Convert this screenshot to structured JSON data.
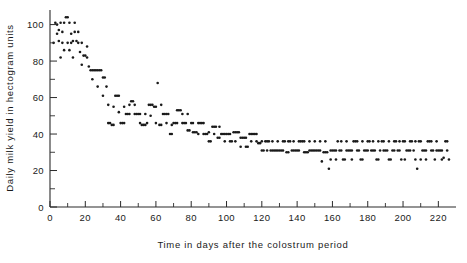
{
  "chart_data": {
    "type": "scatter",
    "title": "",
    "xlabel": "Time in days after the colostrum period",
    "ylabel": "Daily milk yield in hectogram units",
    "xlim": [
      0,
      230
    ],
    "ylim": [
      0,
      108
    ],
    "xticks": [
      0,
      20,
      40,
      60,
      80,
      100,
      120,
      140,
      160,
      180,
      200,
      220
    ],
    "yticks": [
      0,
      20,
      40,
      60,
      80,
      100
    ],
    "xtick_labels": [
      "0",
      "20",
      "40",
      "60",
      "80",
      "100",
      "120",
      "140",
      "160",
      "180",
      "200",
      "220"
    ],
    "ytick_labels": [
      "0",
      "20",
      "40",
      "60",
      "80",
      "100"
    ],
    "x_minor_step": 10,
    "y_minor_step": 10,
    "grid": false,
    "legend": null,
    "marker": "dot",
    "marker_size": 1.3,
    "marker_color": "#1a1a1a",
    "points": [
      [
        2,
        90
      ],
      [
        3,
        101
      ],
      [
        4,
        100
      ],
      [
        4,
        95
      ],
      [
        5,
        91
      ],
      [
        5,
        97
      ],
      [
        6,
        101
      ],
      [
        7,
        90
      ],
      [
        7,
        96
      ],
      [
        8,
        86
      ],
      [
        9,
        104
      ],
      [
        10,
        104
      ],
      [
        11,
        101
      ],
      [
        12,
        95
      ],
      [
        12,
        90
      ],
      [
        13,
        82
      ],
      [
        14,
        101
      ],
      [
        14,
        96
      ],
      [
        15,
        91
      ],
      [
        16,
        90
      ],
      [
        17,
        85
      ],
      [
        18,
        78
      ],
      [
        19,
        83
      ],
      [
        20,
        83
      ],
      [
        21,
        82
      ],
      [
        22,
        77
      ],
      [
        23,
        75
      ],
      [
        24,
        75
      ],
      [
        25,
        75
      ],
      [
        26,
        75
      ],
      [
        27,
        75
      ],
      [
        28,
        75
      ],
      [
        29,
        75
      ],
      [
        30,
        71
      ],
      [
        31,
        71
      ],
      [
        32,
        66
      ],
      [
        33,
        46
      ],
      [
        34,
        46
      ],
      [
        35,
        45
      ],
      [
        36,
        45
      ],
      [
        37,
        61
      ],
      [
        38,
        61
      ],
      [
        39,
        61
      ],
      [
        40,
        46
      ],
      [
        41,
        46
      ],
      [
        42,
        46
      ],
      [
        43,
        51
      ],
      [
        44,
        51
      ],
      [
        45,
        51
      ],
      [
        46,
        58
      ],
      [
        47,
        58
      ],
      [
        48,
        51
      ],
      [
        49,
        51
      ],
      [
        50,
        51
      ],
      [
        51,
        51
      ],
      [
        52,
        45
      ],
      [
        53,
        45
      ],
      [
        54,
        45
      ],
      [
        55,
        46
      ],
      [
        56,
        56
      ],
      [
        57,
        56
      ],
      [
        58,
        56
      ],
      [
        59,
        55
      ],
      [
        60,
        55
      ],
      [
        61,
        68
      ],
      [
        62,
        45
      ],
      [
        63,
        45
      ],
      [
        64,
        51
      ],
      [
        65,
        51
      ],
      [
        66,
        51
      ],
      [
        67,
        51
      ],
      [
        68,
        40
      ],
      [
        69,
        40
      ],
      [
        70,
        46
      ],
      [
        71,
        46
      ],
      [
        72,
        53
      ],
      [
        73,
        53
      ],
      [
        74,
        53
      ],
      [
        75,
        46
      ],
      [
        76,
        46
      ],
      [
        77,
        46
      ],
      [
        78,
        42
      ],
      [
        79,
        42
      ],
      [
        80,
        46
      ],
      [
        81,
        41
      ],
      [
        82,
        41
      ],
      [
        83,
        41
      ],
      [
        84,
        46
      ],
      [
        85,
        46
      ],
      [
        86,
        46
      ],
      [
        87,
        46
      ],
      [
        88,
        40
      ],
      [
        89,
        40
      ],
      [
        90,
        36
      ],
      [
        91,
        36
      ],
      [
        92,
        44
      ],
      [
        93,
        44
      ],
      [
        94,
        44
      ],
      [
        95,
        38
      ],
      [
        96,
        38
      ],
      [
        97,
        40
      ],
      [
        98,
        40
      ],
      [
        99,
        40
      ],
      [
        100,
        40
      ],
      [
        101,
        40
      ],
      [
        102,
        36
      ],
      [
        103,
        36
      ],
      [
        104,
        41
      ],
      [
        105,
        41
      ],
      [
        106,
        41
      ],
      [
        107,
        41
      ],
      [
        108,
        38
      ],
      [
        109,
        38
      ],
      [
        110,
        38
      ],
      [
        111,
        33
      ],
      [
        112,
        33
      ],
      [
        113,
        40
      ],
      [
        114,
        40
      ],
      [
        115,
        40
      ],
      [
        116,
        40
      ],
      [
        117,
        40
      ],
      [
        118,
        35
      ],
      [
        119,
        35
      ],
      [
        120,
        31
      ],
      [
        121,
        31
      ],
      [
        122,
        36
      ],
      [
        123,
        36
      ],
      [
        124,
        36
      ],
      [
        125,
        31
      ],
      [
        126,
        31
      ],
      [
        127,
        31
      ],
      [
        128,
        31
      ],
      [
        129,
        31
      ],
      [
        130,
        31
      ],
      [
        131,
        31
      ],
      [
        132,
        36
      ],
      [
        133,
        36
      ],
      [
        134,
        30
      ],
      [
        135,
        30
      ],
      [
        136,
        36
      ],
      [
        137,
        31
      ],
      [
        138,
        31
      ],
      [
        139,
        31
      ],
      [
        140,
        31
      ],
      [
        141,
        31
      ],
      [
        142,
        36
      ],
      [
        143,
        36
      ],
      [
        144,
        30
      ],
      [
        145,
        30
      ],
      [
        146,
        30
      ],
      [
        147,
        31
      ],
      [
        148,
        31
      ],
      [
        149,
        31
      ],
      [
        150,
        36
      ],
      [
        151,
        31
      ],
      [
        152,
        31
      ],
      [
        153,
        31
      ],
      [
        154,
        25
      ],
      [
        155,
        30
      ],
      [
        156,
        30
      ],
      [
        157,
        30
      ],
      [
        158,
        21
      ],
      [
        159,
        31
      ],
      [
        160,
        31
      ],
      [
        161,
        31
      ],
      [
        162,
        31
      ],
      [
        163,
        36
      ],
      [
        164,
        31
      ],
      [
        165,
        31
      ],
      [
        166,
        26
      ],
      [
        167,
        26
      ],
      [
        168,
        31
      ],
      [
        169,
        31
      ],
      [
        170,
        31
      ],
      [
        171,
        31
      ],
      [
        172,
        36
      ],
      [
        173,
        36
      ],
      [
        174,
        31
      ],
      [
        175,
        31
      ],
      [
        176,
        26
      ],
      [
        177,
        26
      ],
      [
        178,
        31
      ],
      [
        179,
        31
      ],
      [
        180,
        36
      ],
      [
        181,
        36
      ],
      [
        182,
        31
      ],
      [
        183,
        31
      ],
      [
        184,
        31
      ],
      [
        185,
        26
      ],
      [
        186,
        26
      ],
      [
        187,
        31
      ],
      [
        188,
        36
      ],
      [
        189,
        36
      ],
      [
        190,
        31
      ],
      [
        191,
        31
      ],
      [
        192,
        26
      ],
      [
        193,
        26
      ],
      [
        194,
        31
      ],
      [
        195,
        36
      ],
      [
        196,
        36
      ],
      [
        197,
        31
      ],
      [
        198,
        31
      ],
      [
        199,
        26
      ],
      [
        200,
        36
      ],
      [
        201,
        36
      ],
      [
        202,
        31
      ],
      [
        203,
        31
      ],
      [
        204,
        36
      ],
      [
        205,
        36
      ],
      [
        206,
        31
      ],
      [
        207,
        26
      ],
      [
        208,
        21
      ],
      [
        209,
        36
      ],
      [
        210,
        36
      ],
      [
        211,
        31
      ],
      [
        212,
        31
      ],
      [
        213,
        26
      ],
      [
        214,
        36
      ],
      [
        215,
        36
      ],
      [
        216,
        31
      ],
      [
        217,
        31
      ],
      [
        218,
        26
      ],
      [
        219,
        36
      ],
      [
        220,
        31
      ],
      [
        221,
        31
      ],
      [
        222,
        26
      ],
      [
        223,
        27
      ],
      [
        224,
        36
      ],
      [
        225,
        31
      ],
      [
        226,
        26
      ],
      [
        6,
        82
      ],
      [
        8,
        101
      ],
      [
        10,
        90
      ],
      [
        11,
        86
      ],
      [
        13,
        91
      ],
      [
        16,
        96
      ],
      [
        18,
        90
      ],
      [
        21,
        88
      ],
      [
        24,
        70
      ],
      [
        27,
        66
      ],
      [
        30,
        61
      ],
      [
        33,
        56
      ],
      [
        36,
        55
      ],
      [
        39,
        52
      ],
      [
        42,
        55
      ],
      [
        45,
        56
      ],
      [
        48,
        56
      ],
      [
        51,
        46
      ],
      [
        54,
        51
      ],
      [
        57,
        50
      ],
      [
        60,
        46
      ],
      [
        63,
        56
      ],
      [
        66,
        46
      ],
      [
        69,
        45
      ],
      [
        72,
        46
      ],
      [
        75,
        51
      ],
      [
        78,
        51
      ],
      [
        81,
        46
      ],
      [
        84,
        40
      ],
      [
        87,
        40
      ],
      [
        90,
        41
      ],
      [
        93,
        40
      ],
      [
        96,
        44
      ],
      [
        99,
        36
      ],
      [
        102,
        40
      ],
      [
        105,
        36
      ],
      [
        108,
        33
      ],
      [
        111,
        38
      ],
      [
        114,
        36
      ],
      [
        117,
        36
      ],
      [
        120,
        36
      ],
      [
        123,
        31
      ],
      [
        126,
        36
      ],
      [
        129,
        36
      ],
      [
        132,
        31
      ],
      [
        135,
        36
      ],
      [
        138,
        36
      ],
      [
        141,
        36
      ],
      [
        144,
        36
      ],
      [
        147,
        36
      ],
      [
        150,
        31
      ],
      [
        153,
        36
      ],
      [
        156,
        36
      ],
      [
        159,
        26
      ],
      [
        162,
        26
      ],
      [
        165,
        36
      ],
      [
        168,
        36
      ],
      [
        171,
        26
      ],
      [
        174,
        36
      ],
      [
        177,
        36
      ],
      [
        180,
        31
      ],
      [
        183,
        36
      ],
      [
        186,
        36
      ],
      [
        189,
        31
      ],
      [
        192,
        36
      ],
      [
        195,
        31
      ],
      [
        198,
        36
      ],
      [
        201,
        26
      ],
      [
        204,
        31
      ],
      [
        207,
        36
      ],
      [
        210,
        26
      ],
      [
        213,
        31
      ],
      [
        216,
        36
      ],
      [
        219,
        31
      ],
      [
        222,
        31
      ],
      [
        225,
        36
      ]
    ]
  },
  "axes": {
    "x_axis_name": "x-axis",
    "y_axis_name": "y-axis"
  }
}
